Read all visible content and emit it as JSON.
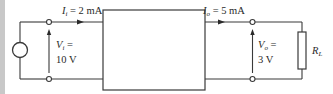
{
  "diagram": {
    "type": "two-port network circuit",
    "colors": {
      "wire": "#3a3a3a",
      "left_bar": "#c8c8c8",
      "background": "#ffffff"
    },
    "source": {
      "icon": "voltage-source-circle"
    },
    "input": {
      "current_symbol": "I",
      "current_subscript": "i",
      "current_value": "= 2 mA",
      "voltage_symbol": "V",
      "voltage_subscript": "i",
      "voltage_eq": "=",
      "voltage_value": "10 V"
    },
    "network": {
      "icon": "two-port-network-box"
    },
    "output": {
      "current_symbol": "I",
      "current_subscript": "o",
      "current_value": "= 5 mA",
      "voltage_symbol": "V",
      "voltage_subscript": "o",
      "voltage_eq": "=",
      "voltage_value": "3 V"
    },
    "load": {
      "symbol": "R",
      "subscript": "L",
      "icon": "resistor"
    }
  }
}
